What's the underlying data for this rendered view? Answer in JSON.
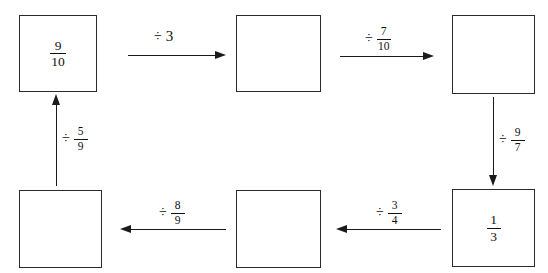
{
  "diagram": {
    "background_color": "#ffffff",
    "stroke_color": "#2b2b2b",
    "boxes": [
      {
        "id": "box-1",
        "position": "top-left",
        "value_numerator": "9",
        "value_denominator": "10",
        "empty": false
      },
      {
        "id": "box-2",
        "position": "top-middle",
        "value_numerator": "",
        "value_denominator": "",
        "empty": true
      },
      {
        "id": "box-3",
        "position": "top-right",
        "value_numerator": "",
        "value_denominator": "",
        "empty": true
      },
      {
        "id": "box-4",
        "position": "bottom-right",
        "value_numerator": "1",
        "value_denominator": "3",
        "empty": false
      },
      {
        "id": "box-5",
        "position": "bottom-middle",
        "value_numerator": "",
        "value_denominator": "",
        "empty": true
      },
      {
        "id": "box-6",
        "position": "bottom-left",
        "value_numerator": "",
        "value_denominator": "",
        "empty": true
      }
    ],
    "arrows": [
      {
        "id": "arrow-1",
        "direction": "right",
        "from": "box-1",
        "to": "box-2",
        "operator": "÷",
        "whole": "3",
        "numerator": "",
        "denominator": ""
      },
      {
        "id": "arrow-2",
        "direction": "right",
        "from": "box-2",
        "to": "box-3",
        "operator": "÷",
        "whole": "",
        "numerator": "7",
        "denominator": "10"
      },
      {
        "id": "arrow-3",
        "direction": "down",
        "from": "box-3",
        "to": "box-4",
        "operator": "÷",
        "whole": "",
        "numerator": "9",
        "denominator": "7"
      },
      {
        "id": "arrow-4",
        "direction": "left",
        "from": "box-4",
        "to": "box-5",
        "operator": "÷",
        "whole": "",
        "numerator": "3",
        "denominator": "4"
      },
      {
        "id": "arrow-5",
        "direction": "left",
        "from": "box-5",
        "to": "box-6",
        "operator": "÷",
        "whole": "",
        "numerator": "8",
        "denominator": "9"
      },
      {
        "id": "arrow-6",
        "direction": "up",
        "from": "box-6",
        "to": "box-1",
        "operator": "÷",
        "whole": "",
        "numerator": "5",
        "denominator": "9"
      }
    ]
  }
}
